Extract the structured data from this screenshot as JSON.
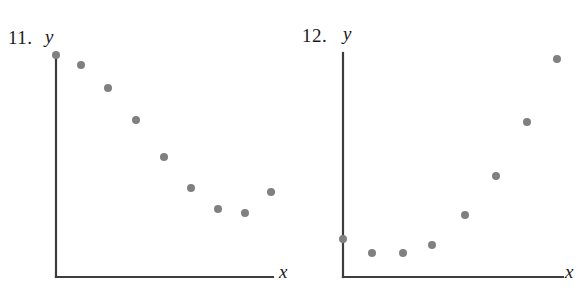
{
  "page": {
    "background_color": "#ffffff",
    "axis_color": "#3d3d3d",
    "point_color": "#808080",
    "text_color": "#1a1a1a"
  },
  "chart_data": [
    {
      "type": "scatter",
      "title": "11.",
      "number_label": "11.",
      "xlabel": "x",
      "ylabel": "y",
      "grid": false,
      "legend": null,
      "axis_origin_px": {
        "x": 56,
        "y": 277
      },
      "axis_top_px": 55,
      "axis_right_px": 273,
      "xlim": [
        0,
        10
      ],
      "ylim": [
        0,
        10
      ],
      "description": "Decreasing then leveling scatter, suggests exponential decay / quadratic with minimum near right side",
      "points_px": [
        {
          "x": 56,
          "y": 55
        },
        {
          "x": 81,
          "y": 65
        },
        {
          "x": 108,
          "y": 88
        },
        {
          "x": 136,
          "y": 120
        },
        {
          "x": 164,
          "y": 157
        },
        {
          "x": 191,
          "y": 188
        },
        {
          "x": 218,
          "y": 209
        },
        {
          "x": 245,
          "y": 213
        },
        {
          "x": 271,
          "y": 192
        }
      ],
      "x": [
        0.0,
        1.13,
        2.35,
        3.6,
        4.86,
        6.08,
        7.29,
        8.51,
        9.68
      ],
      "y": [
        10.0,
        9.55,
        8.51,
        7.06,
        5.39,
        4.01,
        3.06,
        2.88,
        3.83
      ]
    },
    {
      "type": "scatter",
      "title": "12.",
      "number_label": "12.",
      "xlabel": "x",
      "ylabel": "y",
      "grid": false,
      "legend": null,
      "axis_origin_px": {
        "x": 343,
        "y": 277
      },
      "axis_top_px": 53,
      "axis_right_px": 563,
      "xlim": [
        0,
        10
      ],
      "ylim": [
        0,
        10
      ],
      "description": "Flat then sharply increasing scatter, suggests exponential growth",
      "points_px": [
        {
          "x": 343,
          "y": 239
        },
        {
          "x": 372,
          "y": 253
        },
        {
          "x": 403,
          "y": 253
        },
        {
          "x": 432,
          "y": 245
        },
        {
          "x": 465,
          "y": 215
        },
        {
          "x": 496,
          "y": 176
        },
        {
          "x": 527,
          "y": 122
        },
        {
          "x": 557,
          "y": 59
        }
      ],
      "x": [
        0.0,
        1.32,
        2.73,
        4.05,
        5.55,
        6.95,
        8.36,
        9.73
      ],
      "y": [
        1.7,
        1.07,
        1.07,
        1.43,
        2.77,
        4.51,
        6.92,
        9.73
      ]
    }
  ],
  "panels": [
    {
      "id": "panel-11",
      "number": "11.",
      "y_label": "y",
      "x_label": "x"
    },
    {
      "id": "panel-12",
      "number": "12.",
      "y_label": "y",
      "x_label": "x"
    }
  ]
}
